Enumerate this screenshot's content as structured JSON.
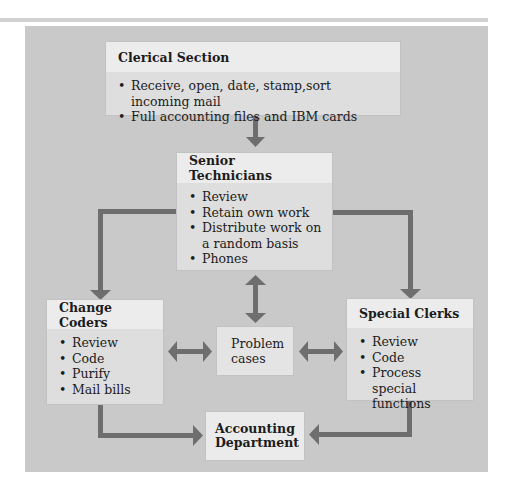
{
  "diagram": {
    "colors": {
      "panel": "#c9c9c9",
      "box": "#dedede",
      "box_header": "#ececec",
      "arrow": "#6e6e6e",
      "top_rule": "#d2d2d2"
    },
    "nodes": {
      "clerical": {
        "title": "Clerical Section",
        "items": [
          "Receive, open, date, stamp,sort incoming mail",
          "Full accounting files and IBM cards"
        ]
      },
      "senior": {
        "title": "Senior Technicians",
        "items": [
          "Review",
          "Retain own work",
          "Distribute work on a random basis",
          "Phones"
        ]
      },
      "change_coders": {
        "title": "Change Coders",
        "items": [
          "Review",
          "Code",
          "Purify",
          "Mail bills"
        ]
      },
      "special_clerks": {
        "title": "Special Clerks",
        "items": [
          "Review",
          "Code",
          "Process special functions"
        ]
      },
      "problem_cases": {
        "label": "Problem cases"
      },
      "accounting": {
        "label": "Accounting Department"
      }
    },
    "edges": [
      {
        "from": "Clerical Section",
        "to": "Senior Technicians",
        "type": "arrow"
      },
      {
        "from": "Senior Technicians",
        "to": "Change Coders",
        "type": "arrow"
      },
      {
        "from": "Senior Technicians",
        "to": "Special Clerks",
        "type": "arrow"
      },
      {
        "from": "Senior Technicians",
        "to": "Problem cases",
        "type": "bidirectional"
      },
      {
        "from": "Change Coders",
        "to": "Problem cases",
        "type": "bidirectional"
      },
      {
        "from": "Problem cases",
        "to": "Special Clerks",
        "type": "bidirectional"
      },
      {
        "from": "Change Coders",
        "to": "Accounting Department",
        "type": "arrow"
      },
      {
        "from": "Special Clerks",
        "to": "Accounting Department",
        "type": "arrow"
      }
    ]
  }
}
